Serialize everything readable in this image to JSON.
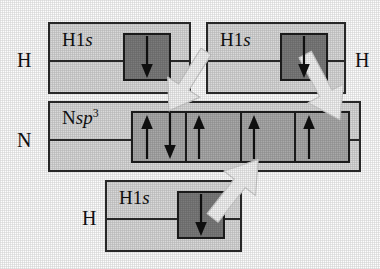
{
  "figure": {
    "background_color": "#fdfdfd",
    "panel_fill": "#d9d9d9",
    "orbital_box_fill_dark": "#7b7b7b",
    "orbital_box_fill_light": "#a9a9a9",
    "line_color": "#2b2b2b",
    "overlap_arrow_color": "#f2f2f2"
  },
  "atoms": {
    "h_top_left": "H",
    "h_top_right": "H",
    "h_bottom": "H",
    "n_center": "N"
  },
  "orbitals": {
    "h_top_left": {
      "element": "H",
      "shell": "1",
      "subshell": "s",
      "label_text": "H1s"
    },
    "h_top_right": {
      "element": "H",
      "shell": "1",
      "subshell": "s",
      "label_text": "H1s"
    },
    "h_bottom": {
      "element": "H",
      "shell": "1",
      "subshell": "s",
      "label_text": "H1s"
    },
    "n_center": {
      "element": "N",
      "subshell": "sp",
      "superscript": "3",
      "label_text": "Nsp3"
    }
  },
  "electrons": {
    "h_top_left": {
      "count": 1,
      "spins": [
        "down"
      ]
    },
    "h_top_right": {
      "count": 1,
      "spins": [
        "down"
      ]
    },
    "h_bottom": {
      "count": 1,
      "spins": [
        "down"
      ]
    },
    "n_sp3_cells": [
      {
        "index": 1,
        "count": 2,
        "spins": [
          "up",
          "down"
        ],
        "description": "lone pair"
      },
      {
        "index": 2,
        "count": 1,
        "spins": [
          "up"
        ],
        "description": "unpaired"
      },
      {
        "index": 3,
        "count": 1,
        "spins": [
          "up"
        ],
        "description": "unpaired"
      },
      {
        "index": 4,
        "count": 1,
        "spins": [
          "up"
        ],
        "description": "unpaired"
      }
    ],
    "n_sp3_cell_count": 4
  },
  "overlaps": [
    {
      "id": 1,
      "from": "h_top_left",
      "to": "n_sp3_cell_2",
      "direction": "down-right"
    },
    {
      "id": 2,
      "from": "h_top_right",
      "to": "n_sp3_cell_4",
      "direction": "down-left"
    },
    {
      "id": 3,
      "from": "h_bottom",
      "to": "n_sp3_cell_3",
      "direction": "up-right"
    }
  ]
}
